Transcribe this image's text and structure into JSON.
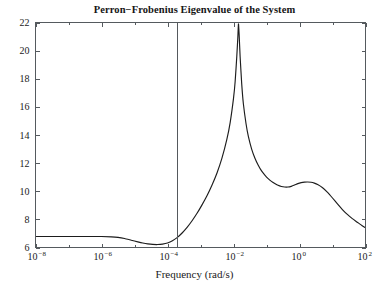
{
  "chart_data": {
    "type": "line",
    "title": "Perron−Frobenius Eigenvalue of the System",
    "xlabel": "Frequency (rad/s)",
    "ylabel": "",
    "xscale": "log",
    "yscale": "linear",
    "xlim": [
      1e-08,
      100
    ],
    "ylim": [
      6,
      22
    ],
    "grid": false,
    "legend": null,
    "xticks": [
      {
        "value": 1e-08,
        "label": "10",
        "exponent": "−8"
      },
      {
        "value": 1e-06,
        "label": "10",
        "exponent": "−6"
      },
      {
        "value": 0.0001,
        "label": "10",
        "exponent": "−4"
      },
      {
        "value": 0.01,
        "label": "10",
        "exponent": "−2"
      },
      {
        "value": 1.0,
        "label": "10",
        "exponent": "0"
      },
      {
        "value": 100.0,
        "label": "10",
        "exponent": "2"
      }
    ],
    "xminor_decades": [
      -7,
      -5,
      -3,
      -1,
      1
    ],
    "yticks": [
      6,
      8,
      10,
      12,
      14,
      16,
      18,
      20,
      22
    ],
    "annotations": [
      {
        "name": "vertical-cursor-line",
        "type": "vline",
        "x": 0.00019,
        "color": "#55595d"
      }
    ],
    "series": [
      {
        "name": "perron-frobenius-eigenvalue",
        "color": "#1d1d1d",
        "x_log10": [
          -8.0,
          -7.6,
          -7.2,
          -6.8,
          -6.4,
          -6.0,
          -5.7,
          -5.5,
          -5.3,
          -5.1,
          -4.9,
          -4.75,
          -4.6,
          -4.45,
          -4.3,
          -4.15,
          -4.0,
          -3.85,
          -3.7,
          -3.55,
          -3.4,
          -3.25,
          -3.1,
          -2.95,
          -2.8,
          -2.65,
          -2.5,
          -2.35,
          -2.2,
          -2.1,
          -2.0,
          -1.95,
          -1.9,
          -1.87,
          -1.85,
          -1.83,
          -1.8,
          -1.75,
          -1.7,
          -1.62,
          -1.55,
          -1.45,
          -1.35,
          -1.25,
          -1.15,
          -1.05,
          -0.95,
          -0.85,
          -0.75,
          -0.65,
          -0.55,
          -0.45,
          -0.35,
          -0.25,
          -0.15,
          -0.05,
          0.05,
          0.15,
          0.25,
          0.35,
          0.45,
          0.55,
          0.7,
          0.85,
          1.0,
          1.15,
          1.3,
          1.45,
          1.6,
          1.75,
          1.9,
          2.0
        ],
        "y": [
          6.78,
          6.78,
          6.78,
          6.78,
          6.78,
          6.78,
          6.76,
          6.72,
          6.64,
          6.52,
          6.4,
          6.32,
          6.26,
          6.22,
          6.21,
          6.24,
          6.32,
          6.48,
          6.72,
          7.05,
          7.45,
          7.92,
          8.45,
          9.05,
          9.7,
          10.45,
          11.3,
          12.35,
          13.7,
          14.9,
          16.6,
          17.8,
          19.6,
          20.9,
          21.9,
          21.2,
          19.6,
          17.6,
          16.2,
          14.8,
          13.9,
          13.0,
          12.35,
          11.85,
          11.45,
          11.15,
          10.9,
          10.7,
          10.55,
          10.42,
          10.34,
          10.3,
          10.3,
          10.35,
          10.44,
          10.54,
          10.61,
          10.65,
          10.66,
          10.64,
          10.58,
          10.48,
          10.25,
          9.92,
          9.52,
          9.1,
          8.7,
          8.35,
          8.05,
          7.8,
          7.55,
          7.4
        ]
      }
    ]
  },
  "axes": {
    "frame_color": "#555a5e"
  }
}
